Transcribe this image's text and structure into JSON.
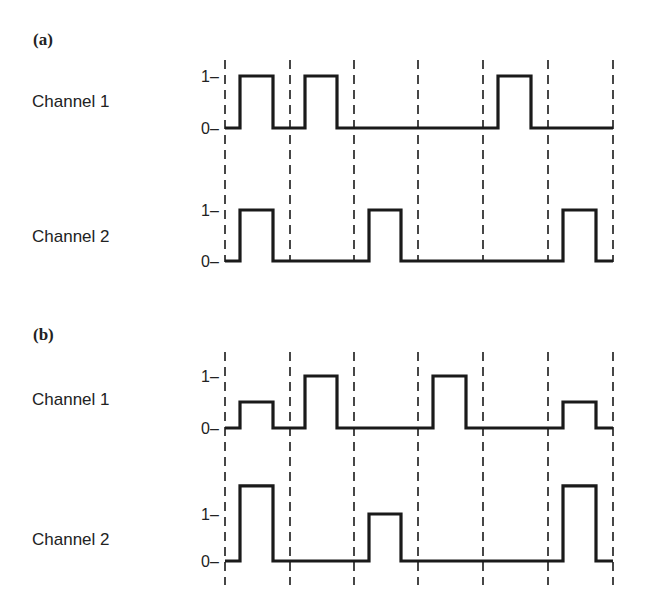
{
  "panels": [
    {
      "id": "a",
      "label": "(a)",
      "dash_y": [
        60,
        262
      ],
      "channels": [
        {
          "label": "Channel 1",
          "y_one": 76,
          "y_zero": 128,
          "tick_one": "1",
          "tick_zero": "0",
          "levels": [
            1,
            1,
            0,
            0,
            1,
            0,
            1
          ],
          "level_scale": [
            1,
            1,
            0,
            0,
            1,
            0,
            1
          ]
        },
        {
          "label": "Channel 2",
          "y_one": 210,
          "y_zero": 261,
          "tick_one": "1",
          "tick_zero": "0",
          "levels": [
            1,
            0,
            1,
            0,
            0,
            1
          ],
          "level_scale": [
            1,
            0,
            1,
            0,
            0,
            1
          ]
        }
      ]
    },
    {
      "id": "b",
      "label": "(b)",
      "dash_y": [
        352,
        585
      ],
      "channels": [
        {
          "label": "Channel 1",
          "y_one": 376,
          "y_zero": 428,
          "tick_one": "1",
          "tick_zero": "0",
          "levels": [
            0.5,
            1,
            0,
            1,
            0,
            0.5
          ]
        },
        {
          "label": "Channel 2",
          "y_one": 514,
          "y_zero": 561,
          "tick_one": "1",
          "tick_zero": "0",
          "levels": [
            1.6,
            0,
            1,
            0,
            0,
            1.6
          ]
        }
      ]
    }
  ],
  "slot_boundaries_x": [
    225,
    290,
    354,
    418,
    483,
    548,
    613
  ],
  "pulse_inset": {
    "rise": 15,
    "fall_before_end": 17
  },
  "colors": {
    "line": "#1a1a1a",
    "background": "#ffffff"
  },
  "chart_data": {
    "type": "line",
    "title": "",
    "x": [
      "slot 1",
      "slot 2",
      "slot 3",
      "slot 4",
      "slot 5",
      "slot 6"
    ],
    "series": [
      {
        "name": "(a) Channel 1",
        "values": [
          1,
          1,
          0,
          1,
          0,
          1
        ]
      },
      {
        "name": "(a) Channel 2",
        "values": [
          1,
          0,
          1,
          0,
          0,
          1
        ]
      },
      {
        "name": "(b) Channel 1",
        "values": [
          0.5,
          1,
          0,
          1,
          0,
          0.5
        ]
      },
      {
        "name": "(b) Channel 2",
        "values": [
          1.6,
          0,
          1,
          0,
          0,
          1.6
        ]
      }
    ],
    "ylabel_ticks": [
      "0",
      "1"
    ],
    "grid": "vertical dashed slot boundaries"
  }
}
